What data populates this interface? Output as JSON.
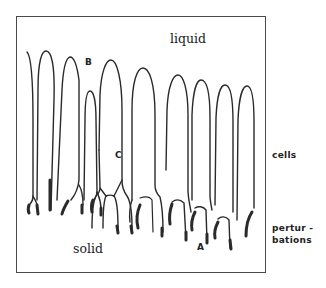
{
  "figure": {
    "regions": {
      "liquid": "liquid",
      "solid": "solid"
    },
    "markers": {
      "a": "A",
      "b": "B",
      "c": "C"
    },
    "side_labels": {
      "cells": "cells",
      "perturbations_line1": "pertur -",
      "perturbations_line2": "bations"
    },
    "colors": {
      "ink": "#2a2a2a",
      "frame": "#4a4a4a",
      "background": "#ffffff"
    },
    "cell_count": 10
  }
}
